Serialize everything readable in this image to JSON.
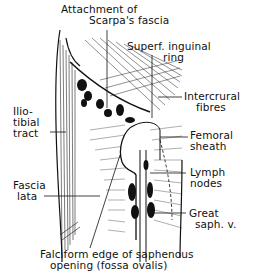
{
  "figure": {
    "labels": {
      "scarpa": [
        "Attachment of",
        "Scarpa's fascia"
      ],
      "superf_ring": [
        "Superf. inguinal",
        "ring"
      ],
      "intercrural": [
        "Intercrural",
        "fibres"
      ],
      "iliotibial": [
        "Ilio-",
        "tibial",
        "tract"
      ],
      "femoral_sheath": [
        "Femoral",
        "sheath"
      ],
      "lymph_nodes": [
        "Lymph",
        "nodes"
      ],
      "fascia_lata": [
        "Fascia",
        "lata"
      ],
      "great_saph": [
        "Great",
        "saph. v."
      ],
      "falciform": [
        "Falciform edge of saphenous",
        "opening (fossa ovalis)"
      ]
    },
    "colors": {
      "ink": "#111111",
      "paper": "#ffffff"
    }
  }
}
